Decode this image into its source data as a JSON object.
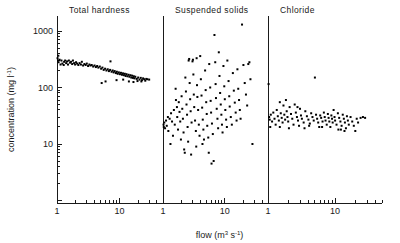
{
  "figure": {
    "axes": {
      "y_label": "concentration (mg l",
      "y_label_sup": "-1",
      "y_label_tail": ")",
      "x_label": "flow (m",
      "x_label_sup": "3",
      "x_label_mid": " s",
      "x_label_sup2": "-1",
      "x_label_tail": ")",
      "y_ticks": [
        "1000",
        "100",
        "10"
      ],
      "x_ticks": [
        "1",
        "10"
      ]
    },
    "panels": [
      {
        "title": "Total hardness"
      },
      {
        "title": "Suspended solids"
      },
      {
        "title": "Chloride"
      }
    ]
  },
  "chart_data": {
    "type": "scatter",
    "title": "",
    "xlabel": "flow (m3 s-1)",
    "ylabel": "concentration (mg l-1)",
    "xscale": "log",
    "yscale": "log",
    "xlim": [
      1,
      50
    ],
    "ylim": [
      3,
      2000
    ],
    "grid": false,
    "legend": "none",
    "ytick_values": [
      1000,
      100,
      10
    ],
    "xtick_values": [
      1,
      10
    ],
    "panels": [
      {
        "name": "Total hardness",
        "xlim": [
          1,
          50
        ],
        "points": [
          [
            1.02,
            330
          ],
          [
            1.04,
            300
          ],
          [
            1.05,
            365
          ],
          [
            1.06,
            280
          ],
          [
            1.1,
            310
          ],
          [
            1.14,
            255
          ],
          [
            1.18,
            300
          ],
          [
            1.22,
            265
          ],
          [
            1.28,
            250
          ],
          [
            1.3,
            285
          ],
          [
            1.35,
            300
          ],
          [
            1.4,
            270
          ],
          [
            1.45,
            290
          ],
          [
            1.5,
            255
          ],
          [
            1.55,
            300
          ],
          [
            1.62,
            275
          ],
          [
            1.68,
            285
          ],
          [
            1.75,
            260
          ],
          [
            1.8,
            300
          ],
          [
            1.88,
            270
          ],
          [
            1.95,
            255
          ],
          [
            2.02,
            280
          ],
          [
            2.1,
            265
          ],
          [
            2.2,
            250
          ],
          [
            2.3,
            270
          ],
          [
            2.42,
            255
          ],
          [
            2.5,
            285
          ],
          [
            2.62,
            245
          ],
          [
            2.75,
            260
          ],
          [
            2.88,
            250
          ],
          [
            3.0,
            265
          ],
          [
            3.15,
            240
          ],
          [
            3.3,
            255
          ],
          [
            3.45,
            245
          ],
          [
            3.6,
            250
          ],
          [
            3.8,
            235
          ],
          [
            4.0,
            245
          ],
          [
            4.2,
            230
          ],
          [
            4.4,
            240
          ],
          [
            4.6,
            225
          ],
          [
            4.85,
            235
          ],
          [
            5.1,
            215
          ],
          [
            5.35,
            225
          ],
          [
            5.6,
            205
          ],
          [
            5.9,
            215
          ],
          [
            6.2,
            200
          ],
          [
            6.5,
            210
          ],
          [
            6.8,
            195
          ],
          [
            7.1,
            205
          ],
          [
            7.2,
            290
          ],
          [
            7.5,
            190
          ],
          [
            7.8,
            200
          ],
          [
            8.1,
            185
          ],
          [
            8.4,
            195
          ],
          [
            8.8,
            180
          ],
          [
            9.1,
            190
          ],
          [
            9.4,
            175
          ],
          [
            9.8,
            185
          ],
          [
            10.2,
            172
          ],
          [
            10.6,
            182
          ],
          [
            11.0,
            168
          ],
          [
            11.4,
            178
          ],
          [
            11.8,
            165
          ],
          [
            12.2,
            175
          ],
          [
            12.6,
            160
          ],
          [
            13.0,
            172
          ],
          [
            13.5,
            158
          ],
          [
            14.0,
            168
          ],
          [
            14.5,
            155
          ],
          [
            15.0,
            165
          ],
          [
            15.5,
            150
          ],
          [
            16.0,
            162
          ],
          [
            16.5,
            148
          ],
          [
            17.0,
            158
          ],
          [
            17.5,
            145
          ],
          [
            18.0,
            155
          ],
          [
            19.0,
            142
          ],
          [
            20.0,
            150
          ],
          [
            21.0,
            138
          ],
          [
            22.0,
            148
          ],
          [
            23.0,
            135
          ],
          [
            24.0,
            145
          ],
          [
            25.0,
            140
          ],
          [
            26.0,
            132
          ],
          [
            27.0,
            142
          ],
          [
            5.2,
            120
          ],
          [
            6.0,
            128
          ],
          [
            14.2,
            128
          ],
          [
            16.8,
            125
          ],
          [
            19.5,
            130
          ],
          [
            22.5,
            128
          ],
          [
            28.0,
            140
          ],
          [
            30.0,
            138
          ],
          [
            9.0,
            135
          ],
          [
            11.5,
            138
          ]
        ]
      },
      {
        "name": "Suspended solids",
        "xlim": [
          1,
          50
        ],
        "points": [
          [
            1.02,
            22
          ],
          [
            1.03,
            20
          ],
          [
            1.05,
            24
          ],
          [
            1.08,
            19
          ],
          [
            1.12,
            26
          ],
          [
            1.15,
            21
          ],
          [
            1.2,
            30
          ],
          [
            1.22,
            17
          ],
          [
            1.28,
            28
          ],
          [
            1.32,
            10
          ],
          [
            1.35,
            35
          ],
          [
            1.4,
            25
          ],
          [
            1.45,
            14
          ],
          [
            1.5,
            40
          ],
          [
            1.55,
            22
          ],
          [
            1.6,
            95
          ],
          [
            1.62,
            60
          ],
          [
            1.68,
            45
          ],
          [
            1.7,
            30
          ],
          [
            1.75,
            18
          ],
          [
            1.8,
            55
          ],
          [
            1.85,
            37
          ],
          [
            1.9,
            25
          ],
          [
            1.95,
            12
          ],
          [
            2.0,
            70
          ],
          [
            2.05,
            42
          ],
          [
            2.1,
            28
          ],
          [
            2.15,
            16
          ],
          [
            2.2,
            8
          ],
          [
            2.25,
            7
          ],
          [
            2.3,
            150
          ],
          [
            2.35,
            85
          ],
          [
            2.4,
            50
          ],
          [
            2.45,
            33
          ],
          [
            2.5,
            20
          ],
          [
            2.6,
            300
          ],
          [
            2.65,
            320
          ],
          [
            2.7,
            120
          ],
          [
            2.75,
            62
          ],
          [
            2.8,
            38
          ],
          [
            2.9,
            24
          ],
          [
            3.0,
            290
          ],
          [
            3.05,
            310
          ],
          [
            3.1,
            170
          ],
          [
            3.15,
            75
          ],
          [
            3.2,
            45
          ],
          [
            3.3,
            26
          ],
          [
            3.4,
            17
          ],
          [
            3.5,
            330
          ],
          [
            3.55,
            110
          ],
          [
            3.6,
            68
          ],
          [
            3.7,
            40
          ],
          [
            3.8,
            22
          ],
          [
            3.9,
            14
          ],
          [
            4.0,
            360
          ],
          [
            4.1,
            140
          ],
          [
            4.2,
            72
          ],
          [
            4.3,
            44
          ],
          [
            4.4,
            27
          ],
          [
            4.5,
            18
          ],
          [
            4.6,
            12
          ],
          [
            4.8,
            200
          ],
          [
            4.9,
            90
          ],
          [
            5.0,
            55
          ],
          [
            5.1,
            34
          ],
          [
            5.2,
            21
          ],
          [
            5.4,
            13
          ],
          [
            5.5,
            7
          ],
          [
            5.6,
            260
          ],
          [
            5.8,
            100
          ],
          [
            5.9,
            58
          ],
          [
            6.0,
            36
          ],
          [
            6.2,
            23
          ],
          [
            6.4,
            15
          ],
          [
            6.6,
            5
          ],
          [
            6.8,
            850
          ],
          [
            7.0,
            280
          ],
          [
            7.1,
            115
          ],
          [
            7.2,
            65
          ],
          [
            7.4,
            42
          ],
          [
            7.6,
            28
          ],
          [
            7.8,
            19
          ],
          [
            8.0,
            420
          ],
          [
            8.2,
            160
          ],
          [
            8.4,
            80
          ],
          [
            8.6,
            50
          ],
          [
            8.8,
            33
          ],
          [
            9.0,
            22
          ],
          [
            9.2,
            16
          ],
          [
            9.5,
            240
          ],
          [
            9.8,
            105
          ],
          [
            10.0,
            62
          ],
          [
            10.2,
            40
          ],
          [
            10.5,
            27
          ],
          [
            10.8,
            20
          ],
          [
            11.0,
            300
          ],
          [
            11.5,
            130
          ],
          [
            11.8,
            70
          ],
          [
            12.0,
            46
          ],
          [
            12.5,
            30
          ],
          [
            13.0,
            22
          ],
          [
            13.5,
            180
          ],
          [
            14.0,
            88
          ],
          [
            14.5,
            54
          ],
          [
            15.0,
            36
          ],
          [
            15.5,
            26
          ],
          [
            16.0,
            210
          ],
          [
            16.5,
            95
          ],
          [
            17.0,
            60
          ],
          [
            17.5,
            40
          ],
          [
            18.0,
            28
          ],
          [
            19.0,
            1300
          ],
          [
            20.0,
            250
          ],
          [
            21.0,
            120
          ],
          [
            22.0,
            75
          ],
          [
            23.0,
            48
          ],
          [
            24.0,
            260
          ],
          [
            25.0,
            280
          ],
          [
            26.0,
            140
          ],
          [
            28.0,
            10
          ],
          [
            3.45,
            9
          ],
          [
            4.35,
            10
          ],
          [
            2.55,
            11
          ],
          [
            6.1,
            4.5
          ],
          [
            2.85,
            6.5
          ]
        ]
      },
      {
        "name": "Chloride",
        "xlim": [
          1,
          50
        ],
        "points": [
          [
            1.02,
            115
          ],
          [
            1.04,
            30
          ],
          [
            1.06,
            27
          ],
          [
            1.1,
            33
          ],
          [
            1.15,
            25
          ],
          [
            1.2,
            36
          ],
          [
            1.25,
            28
          ],
          [
            1.3,
            22
          ],
          [
            1.35,
            40
          ],
          [
            1.4,
            31
          ],
          [
            1.45,
            26
          ],
          [
            1.5,
            55
          ],
          [
            1.55,
            35
          ],
          [
            1.6,
            29
          ],
          [
            1.65,
            24
          ],
          [
            1.7,
            48
          ],
          [
            1.75,
            33
          ],
          [
            1.8,
            27
          ],
          [
            1.85,
            60
          ],
          [
            1.9,
            38
          ],
          [
            1.95,
            30
          ],
          [
            2.0,
            25
          ],
          [
            2.1,
            45
          ],
          [
            2.2,
            34
          ],
          [
            2.3,
            28
          ],
          [
            2.4,
            22
          ],
          [
            2.5,
            50
          ],
          [
            2.6,
            36
          ],
          [
            2.7,
            30
          ],
          [
            2.8,
            26
          ],
          [
            2.9,
            21
          ],
          [
            3.0,
            42
          ],
          [
            3.1,
            32
          ],
          [
            3.2,
            28
          ],
          [
            3.4,
            24
          ],
          [
            3.6,
            38
          ],
          [
            3.8,
            31
          ],
          [
            4.0,
            27
          ],
          [
            4.2,
            23
          ],
          [
            4.4,
            35
          ],
          [
            4.6,
            30
          ],
          [
            4.8,
            26
          ],
          [
            5.0,
            150
          ],
          [
            5.2,
            33
          ],
          [
            5.4,
            28
          ],
          [
            5.6,
            24
          ],
          [
            5.8,
            20
          ],
          [
            6.0,
            32
          ],
          [
            6.2,
            29
          ],
          [
            6.5,
            25
          ],
          [
            6.8,
            36
          ],
          [
            7.0,
            30
          ],
          [
            7.2,
            26
          ],
          [
            7.5,
            22
          ],
          [
            7.8,
            34
          ],
          [
            8.0,
            29
          ],
          [
            8.2,
            25
          ],
          [
            8.5,
            20
          ],
          [
            8.8,
            32
          ],
          [
            9.0,
            28
          ],
          [
            9.2,
            24
          ],
          [
            9.5,
            40
          ],
          [
            9.8,
            30
          ],
          [
            10.0,
            26
          ],
          [
            10.5,
            22
          ],
          [
            11.0,
            35
          ],
          [
            11.5,
            29
          ],
          [
            12.0,
            25
          ],
          [
            12.5,
            21
          ],
          [
            13.0,
            33
          ],
          [
            13.5,
            28
          ],
          [
            14.0,
            24
          ],
          [
            14.5,
            19
          ],
          [
            15.0,
            31
          ],
          [
            15.5,
            26
          ],
          [
            16.0,
            22
          ],
          [
            17.0,
            30
          ],
          [
            18.0,
            25
          ],
          [
            19.0,
            21
          ],
          [
            20.0,
            17
          ],
          [
            21.0,
            28
          ],
          [
            22.0,
            24
          ],
          [
            24.0,
            29
          ],
          [
            26.0,
            30
          ],
          [
            28.0,
            29
          ],
          [
            1.08,
            20
          ],
          [
            1.5,
            20
          ],
          [
            2.05,
            19
          ],
          [
            3.5,
            19
          ],
          [
            12.2,
            18
          ],
          [
            13.8,
            17
          ],
          [
            11.2,
            18
          ],
          [
            6.4,
            20
          ],
          [
            4.1,
            21
          ],
          [
            2.75,
            45
          ]
        ]
      }
    ]
  }
}
